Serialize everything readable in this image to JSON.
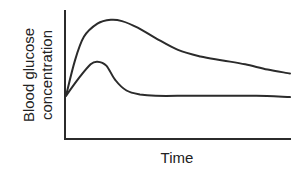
{
  "chart_data": {
    "type": "line",
    "title": "",
    "xlabel": "Time",
    "ylabel_lines": [
      "Blood glucose",
      "concentration"
    ],
    "ylabel": "Blood glucose concentration",
    "grid": false,
    "legend": null,
    "x_ticks": [],
    "y_ticks": [],
    "xlim": [
      0,
      100
    ],
    "ylim": [
      0,
      100
    ],
    "line_color": "#2b2b2b",
    "series": [
      {
        "name": "upper curve (sustained high glucose)",
        "x": [
          0,
          4,
          8,
          14,
          20,
          25,
          32,
          40,
          50,
          60,
          70,
          80,
          90,
          100
        ],
        "y": [
          33,
          60,
          78,
          88,
          91,
          90,
          85,
          77,
          68,
          63,
          60,
          57,
          53,
          50
        ]
      },
      {
        "name": "lower curve (peak then return to baseline)",
        "x": [
          0,
          6,
          11,
          14,
          18,
          22,
          27,
          33,
          40,
          55,
          70,
          85,
          100
        ],
        "y": [
          33,
          47,
          57,
          59,
          56,
          45,
          37,
          34,
          33,
          33,
          33,
          33,
          32
        ]
      }
    ]
  },
  "axes": {
    "x_label": "Time",
    "y_label_line1": "Blood glucose",
    "y_label_line2": "concentration"
  }
}
